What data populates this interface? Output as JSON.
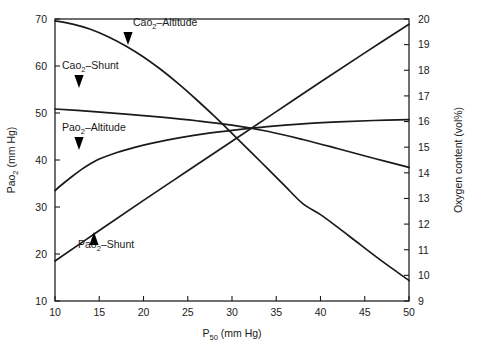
{
  "chart_data": {
    "type": "line",
    "title": "",
    "xlabel": "P50 (mm Hg)",
    "xlabel_main": "P",
    "xlabel_sub": "50",
    "xlabel_unit": " (mm Hg)",
    "ylabel_left": "Pao2 (mm Hg)",
    "ylabel_left_main": "Pao",
    "ylabel_left_sub": "2",
    "ylabel_left_unit": " (mm Hg)",
    "ylabel_right": "Oxygen content (vol%)",
    "xlim": [
      10,
      50
    ],
    "ylim_left": [
      10,
      70
    ],
    "ylim_right": [
      9,
      20
    ],
    "xticks": [
      10,
      15,
      20,
      25,
      30,
      35,
      40,
      45,
      50
    ],
    "xtick_labels": [
      "10",
      "15",
      "20",
      "25",
      "30",
      "35",
      "40",
      "45",
      "50"
    ],
    "yticks_left": [
      10,
      20,
      30,
      40,
      50,
      60,
      70
    ],
    "ytick_labels_left": [
      "10",
      "20",
      "30",
      "40",
      "50",
      "60",
      "70"
    ],
    "yticks_right": [
      9,
      10,
      11,
      12,
      13,
      14,
      15,
      16,
      17,
      18,
      19,
      20
    ],
    "ytick_labels_right": [
      "9",
      "10",
      "11",
      "12",
      "13",
      "14",
      "15",
      "16",
      "17",
      "18",
      "19",
      "20"
    ],
    "grid": false,
    "legend_position": "inline-annotations",
    "series": [
      {
        "name": "Cao2-Altitude",
        "label_main": "Cao",
        "label_sub": "2",
        "label_tail": "–Altitude",
        "axis": "right",
        "color": "#1a1a1a",
        "points": [
          [
            10,
            19.93
          ],
          [
            12,
            19.8
          ],
          [
            14,
            19.6
          ],
          [
            16,
            19.31
          ],
          [
            18,
            18.95
          ],
          [
            20,
            18.52
          ],
          [
            22,
            18.02
          ],
          [
            24,
            17.46
          ],
          [
            26,
            16.85
          ],
          [
            28,
            16.21
          ],
          [
            30,
            15.54
          ],
          [
            32,
            14.86
          ],
          [
            34,
            14.17
          ],
          [
            36,
            13.48
          ],
          [
            38,
            12.8
          ],
          [
            40,
            12.37
          ],
          [
            42,
            11.86
          ],
          [
            44,
            11.33
          ],
          [
            46,
            10.8
          ],
          [
            48,
            10.29
          ],
          [
            50,
            9.8
          ]
        ]
      },
      {
        "name": "Cao2-Shunt",
        "label_main": "Cao",
        "label_sub": "2",
        "label_tail": "–Shunt",
        "axis": "right",
        "color": "#1a1a1a",
        "points": [
          [
            10,
            16.49
          ],
          [
            14,
            16.4
          ],
          [
            18,
            16.29
          ],
          [
            22,
            16.17
          ],
          [
            26,
            16.03
          ],
          [
            30,
            15.86
          ],
          [
            34,
            15.62
          ],
          [
            38,
            15.3
          ],
          [
            42,
            14.94
          ],
          [
            46,
            14.57
          ],
          [
            50,
            14.21
          ]
        ]
      },
      {
        "name": "Pao2-Altitude",
        "label_main": "Pao",
        "label_sub": "2",
        "label_tail": "–Altitude",
        "axis": "left",
        "color": "#1a1a1a",
        "points": [
          [
            10,
            33.5
          ],
          [
            11,
            35.1
          ],
          [
            12,
            36.6
          ],
          [
            13,
            38.0
          ],
          [
            14,
            39.2
          ],
          [
            15,
            40.2
          ],
          [
            17,
            41.6
          ],
          [
            19,
            42.7
          ],
          [
            21,
            43.6
          ],
          [
            24,
            44.7
          ],
          [
            27,
            45.6
          ],
          [
            30,
            46.3
          ],
          [
            34,
            47.1
          ],
          [
            38,
            47.7
          ],
          [
            42,
            48.1
          ],
          [
            46,
            48.4
          ],
          [
            50,
            48.6
          ]
        ]
      },
      {
        "name": "Pao2-Shunt",
        "label_main": "Pao",
        "label_sub": "2",
        "label_tail": "–Shunt",
        "axis": "left",
        "color": "#1a1a1a",
        "points": [
          [
            10,
            18.5
          ],
          [
            15,
            25.0
          ],
          [
            20,
            31.4
          ],
          [
            25,
            37.7
          ],
          [
            30,
            44.0
          ],
          [
            35,
            50.3
          ],
          [
            40,
            56.6
          ],
          [
            45,
            62.8
          ],
          [
            50,
            68.9
          ]
        ]
      }
    ],
    "annotations": [
      {
        "series": "Cao2-Altitude",
        "text_x": 133,
        "text_y": 26,
        "arrow_x": 128,
        "arrow_y": 32,
        "arrow_dir": "down"
      },
      {
        "series": "Cao2-Shunt",
        "text_x": 62,
        "text_y": 69,
        "arrow_x": 79,
        "arrow_y": 75,
        "arrow_dir": "down"
      },
      {
        "series": "Pao2-Altitude",
        "text_x": 62,
        "text_y": 131,
        "arrow_x": 79,
        "arrow_y": 137,
        "arrow_dir": "down"
      },
      {
        "series": "Pao2-Shunt",
        "text_x": 78,
        "text_y": 248,
        "arrow_x": 94,
        "arrow_y": 245,
        "arrow_dir": "up"
      }
    ]
  }
}
